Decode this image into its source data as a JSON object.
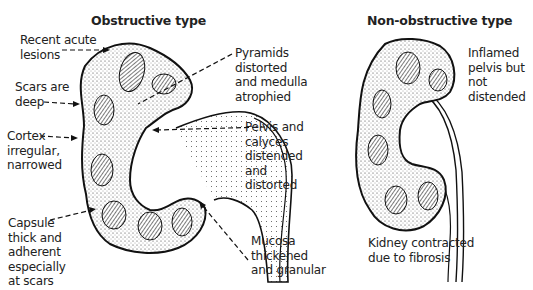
{
  "figure": {
    "panels": [
      {
        "title": "Obstructive type",
        "labels": {
          "recent_acute_lesions": "Recent acute\nlesions",
          "scars_deep": "Scars are\ndeep",
          "cortex": "Cortex\nirregular,\nnarrowed",
          "capsule": "Capsule\nthick and\nadherent\nespecially\nat scars",
          "pyramids": "Pyramids\ndistorted\nand medulla\natrophied",
          "pelvis_calyces": "Pelvis and\ncalyces\ndistended\nand\ndistorted",
          "mucosa": "Mucosa\nthickened\nand granular"
        }
      },
      {
        "title": "Non-obstructive type",
        "labels": {
          "inflamed_pelvis": "Inflamed\npelvis but\nnot\ndistended",
          "kidney_contracted": "Kidney contracted\ndue to fibrosis"
        }
      }
    ]
  }
}
